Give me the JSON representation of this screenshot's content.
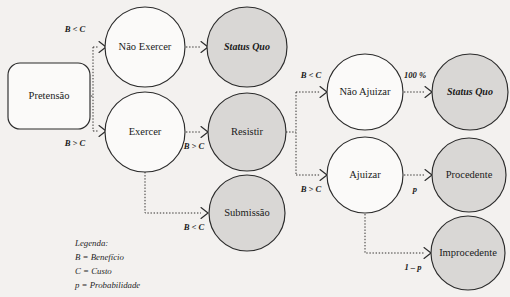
{
  "diagram": {
    "colors": {
      "background": "#f3f1ef",
      "shaded_fill": "#d9d7d5",
      "node_fill": "#fbfaf9",
      "stroke": "#2b2b2b"
    },
    "nodes": [
      {
        "id": "pretensao",
        "label": "Pretensão",
        "shape": "rounded-rect",
        "fill": "white",
        "x": 49,
        "y": 96,
        "w": 82,
        "h": 66
      },
      {
        "id": "nao-exercer",
        "label": "Não Exercer",
        "shape": "circle",
        "fill": "white",
        "cx": 145,
        "cy": 47,
        "r": 40
      },
      {
        "id": "status-quo-1",
        "label": "Status Quo",
        "shape": "circle",
        "fill": "shaded",
        "cx": 247,
        "cy": 47,
        "r": 40,
        "style": "italic"
      },
      {
        "id": "exercer",
        "label": "Exercer",
        "shape": "circle",
        "fill": "white",
        "cx": 145,
        "cy": 132,
        "r": 40
      },
      {
        "id": "resistir",
        "label": "Resistir",
        "shape": "circle",
        "fill": "shaded",
        "cx": 247,
        "cy": 132,
        "r": 39
      },
      {
        "id": "submissao",
        "label": "Submissão",
        "shape": "circle",
        "fill": "shaded",
        "cx": 247,
        "cy": 213,
        "r": 38
      },
      {
        "id": "nao-ajuizar",
        "label": "Não Ajuizar",
        "shape": "circle",
        "fill": "white",
        "cx": 365,
        "cy": 92,
        "r": 38
      },
      {
        "id": "status-quo-2",
        "label": "Status Quo",
        "shape": "circle",
        "fill": "shaded",
        "cx": 470,
        "cy": 92,
        "r": 38,
        "style": "italic"
      },
      {
        "id": "ajuizar",
        "label": "Ajuizar",
        "shape": "circle",
        "fill": "white",
        "cx": 365,
        "cy": 175,
        "r": 38
      },
      {
        "id": "procedente",
        "label": "Procedente",
        "shape": "circle",
        "fill": "shaded",
        "cx": 469,
        "cy": 175,
        "r": 37
      },
      {
        "id": "improcedente",
        "label": "Improcedente",
        "shape": "circle",
        "fill": "shaded",
        "cx": 468,
        "cy": 253,
        "r": 37
      }
    ],
    "edges": [
      {
        "id": "pretensao-nao-exercer",
        "from": "pretensao",
        "to": "nao-exercer",
        "label": "B < C",
        "label_x": 75,
        "label_y": 30
      },
      {
        "id": "pretensao-exercer",
        "from": "pretensao",
        "to": "exercer",
        "label": "B > C",
        "label_x": 75,
        "label_y": 144
      },
      {
        "id": "nao-exercer-status",
        "from": "nao-exercer",
        "to": "status-quo-1",
        "label": "",
        "label_x": 0,
        "label_y": 0
      },
      {
        "id": "exercer-resistir",
        "from": "exercer",
        "to": "resistir",
        "label": "B > C",
        "label_x": 194,
        "label_y": 147
      },
      {
        "id": "exercer-submissao",
        "from": "exercer",
        "to": "submissao",
        "label": "B < C",
        "label_x": 194,
        "label_y": 228
      },
      {
        "id": "resistir-nao-ajuizar",
        "from": "resistir",
        "to": "nao-ajuizar",
        "label": "B < C",
        "label_x": 311,
        "label_y": 76
      },
      {
        "id": "resistir-ajuizar",
        "from": "resistir",
        "to": "ajuizar",
        "label": "B > C",
        "label_x": 311,
        "label_y": 190
      },
      {
        "id": "nao-ajuizar-status",
        "from": "nao-ajuizar",
        "to": "status-quo-2",
        "label": "100 %",
        "label_x": 415,
        "label_y": 76
      },
      {
        "id": "ajuizar-procedente",
        "from": "ajuizar",
        "to": "procedente",
        "label": "p",
        "label_x": 415,
        "label_y": 190
      },
      {
        "id": "ajuizar-improcedente",
        "from": "ajuizar",
        "to": "improcedente",
        "label": "1 – p",
        "label_x": 413,
        "label_y": 268
      }
    ],
    "legend": {
      "title": "Legenda:",
      "entries": [
        "B = Benefício",
        "C = Custo",
        "p = Probabilidade"
      ]
    }
  }
}
